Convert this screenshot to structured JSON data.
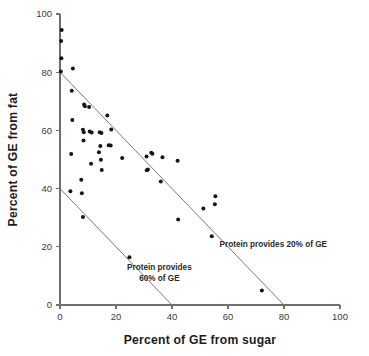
{
  "chart_data": {
    "type": "scatter",
    "title": "",
    "xlabel": "Percent of GE from sugar",
    "ylabel": "Percent of GE from fat",
    "xlim": [
      0,
      100
    ],
    "ylim": [
      0,
      100
    ],
    "xticks": [
      0,
      20,
      40,
      60,
      80,
      100
    ],
    "yticks": [
      0,
      20,
      40,
      60,
      80,
      100
    ],
    "xtick_labels": [
      "0",
      "20",
      "40",
      "60",
      "80",
      "100"
    ],
    "ytick_labels": [
      "0",
      "20",
      "40",
      "60",
      "80",
      "100"
    ],
    "grid": false,
    "legend": null,
    "marker_color": "#151515",
    "marker_size": 4.0,
    "axis_color": "#6f6f6f",
    "line_color": "#6a6a6a",
    "points": [
      {
        "x": 0.6,
        "y": 94.5
      },
      {
        "x": 0.4,
        "y": 90.7
      },
      {
        "x": 0.5,
        "y": 84.8
      },
      {
        "x": 0.3,
        "y": 80.2
      },
      {
        "x": 4.6,
        "y": 81.3
      },
      {
        "x": 4.2,
        "y": 73.6
      },
      {
        "x": 4.4,
        "y": 63.6
      },
      {
        "x": 4.0,
        "y": 51.9
      },
      {
        "x": 3.7,
        "y": 39.1
      },
      {
        "x": 8.6,
        "y": 68.9
      },
      {
        "x": 8.9,
        "y": 68.3
      },
      {
        "x": 8.2,
        "y": 60.2
      },
      {
        "x": 8.5,
        "y": 59.4
      },
      {
        "x": 8.4,
        "y": 56.5
      },
      {
        "x": 7.6,
        "y": 43.0
      },
      {
        "x": 7.8,
        "y": 38.4
      },
      {
        "x": 8.2,
        "y": 30.2
      },
      {
        "x": 10.4,
        "y": 68.0
      },
      {
        "x": 10.6,
        "y": 59.6
      },
      {
        "x": 11.3,
        "y": 59.3
      },
      {
        "x": 11.1,
        "y": 48.5
      },
      {
        "x": 14.2,
        "y": 59.4
      },
      {
        "x": 14.8,
        "y": 59.1
      },
      {
        "x": 14.4,
        "y": 54.6
      },
      {
        "x": 13.9,
        "y": 52.5
      },
      {
        "x": 14.6,
        "y": 49.9
      },
      {
        "x": 14.9,
        "y": 46.4
      },
      {
        "x": 16.9,
        "y": 65.1
      },
      {
        "x": 17.4,
        "y": 54.9
      },
      {
        "x": 18.1,
        "y": 54.8
      },
      {
        "x": 18.3,
        "y": 60.3
      },
      {
        "x": 22.2,
        "y": 50.5
      },
      {
        "x": 24.8,
        "y": 16.4
      },
      {
        "x": 30.9,
        "y": 51.0
      },
      {
        "x": 31.0,
        "y": 46.3
      },
      {
        "x": 31.4,
        "y": 46.6
      },
      {
        "x": 32.6,
        "y": 52.3
      },
      {
        "x": 33.0,
        "y": 52.0
      },
      {
        "x": 36.6,
        "y": 50.8
      },
      {
        "x": 36.0,
        "y": 42.4
      },
      {
        "x": 42.0,
        "y": 49.6
      },
      {
        "x": 42.2,
        "y": 29.4
      },
      {
        "x": 51.2,
        "y": 33.2
      },
      {
        "x": 54.2,
        "y": 23.6
      },
      {
        "x": 55.5,
        "y": 37.4
      },
      {
        "x": 55.3,
        "y": 34.6
      },
      {
        "x": 72.1,
        "y": 5.0
      }
    ],
    "reference_lines": [
      {
        "name": "protein-20-percent-line",
        "label": "Protein provides 20% of GE",
        "label_lines": [
          "Protein provides 20% of GE"
        ],
        "x1": 0,
        "y1": 80,
        "x2": 80,
        "y2": 0
      },
      {
        "name": "protein-60-percent-line",
        "label": "Protein provides 60% of GE",
        "label_lines": [
          "Protein provides",
          "60% of GE"
        ],
        "x1": 0,
        "y1": 40,
        "x2": 40,
        "y2": 0
      }
    ],
    "annotations": [
      {
        "name": "annotation-protein-20",
        "lines": [
          "Protein provides 20% of GE"
        ],
        "x": 57.0,
        "y": 20.0
      },
      {
        "name": "annotation-protein-60",
        "lines": [
          "Protein provides",
          "60% of GE"
        ],
        "x": 35.5,
        "y": 12.0
      }
    ]
  }
}
